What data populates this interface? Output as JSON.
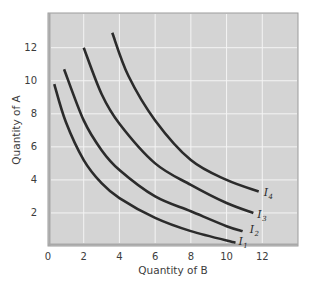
{
  "chart_data": {
    "type": "line",
    "title": "",
    "xlabel": "Quantity of B",
    "ylabel": "Quantity of A",
    "xlim": [
      0,
      14
    ],
    "ylim": [
      0,
      14.1
    ],
    "x_ticks": [
      "0",
      "2",
      "4",
      "6",
      "8",
      "10",
      "12"
    ],
    "y_ticks": [
      "2",
      "4",
      "6",
      "8",
      "10",
      "12"
    ],
    "grid": true,
    "legend": "inline labels at curve ends",
    "colors": {
      "plot_background": "#d4d4d4",
      "gridline": "#f4f4f4",
      "border": "#9c9c9c",
      "curve": "#2b2b2b"
    },
    "series": [
      {
        "name": "I1",
        "label_main": "I",
        "label_sub": "1",
        "points": [
          [
            0.35,
            9.8
          ],
          [
            1,
            7.5
          ],
          [
            2,
            5.2
          ],
          [
            3,
            3.8
          ],
          [
            4,
            2.9
          ],
          [
            6,
            1.7
          ],
          [
            8,
            0.9
          ],
          [
            10.5,
            0.2
          ]
        ]
      },
      {
        "name": "I2",
        "label_main": "I",
        "label_sub": "2",
        "points": [
          [
            0.9,
            10.7
          ],
          [
            2,
            7.6
          ],
          [
            3,
            5.8
          ],
          [
            4,
            4.6
          ],
          [
            6,
            3.0
          ],
          [
            8,
            2.1
          ],
          [
            10,
            1.2
          ],
          [
            10.9,
            0.9
          ]
        ]
      },
      {
        "name": "I3",
        "label_main": "I",
        "label_sub": "3",
        "points": [
          [
            2,
            12.0
          ],
          [
            3,
            9.2
          ],
          [
            4,
            7.4
          ],
          [
            6,
            5.0
          ],
          [
            8,
            3.7
          ],
          [
            10,
            2.6
          ],
          [
            11.5,
            2.0
          ]
        ]
      },
      {
        "name": "I4",
        "label_main": "I",
        "label_sub": "4",
        "points": [
          [
            3.6,
            12.9
          ],
          [
            4.5,
            10.3
          ],
          [
            6,
            7.6
          ],
          [
            8,
            5.2
          ],
          [
            10,
            4.0
          ],
          [
            11.8,
            3.3
          ]
        ]
      }
    ]
  }
}
